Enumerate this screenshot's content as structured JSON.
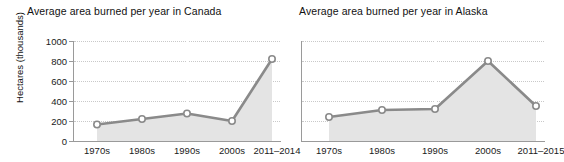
{
  "charts": {
    "canada": {
      "title": "Average area burned per year in Canada",
      "ylabel": "Hectares (thousands)",
      "yticks": [
        "1000",
        "800",
        "600",
        "400",
        "200",
        "0"
      ],
      "xticks": [
        "1970s",
        "1980s",
        "1990s",
        "2000s",
        "2011–2014"
      ]
    },
    "alaska": {
      "title": "Average area burned per year in Alaska",
      "xticks": [
        "1970s",
        "1980s",
        "1990s",
        "2000s",
        "2011–2015"
      ]
    }
  },
  "chart_data": [
    {
      "type": "line",
      "title": "Average area burned per year in Canada",
      "xlabel": "",
      "ylabel": "Hectares (thousands)",
      "categories": [
        "1970s",
        "1980s",
        "1990s",
        "2000s",
        "2011–2014"
      ],
      "values": [
        165,
        220,
        275,
        200,
        820
      ],
      "ylim": [
        0,
        1000
      ],
      "yticks": [
        0,
        200,
        400,
        600,
        800,
        1000
      ],
      "grid": true,
      "legend": "none",
      "marker": "open-circle",
      "fill": "area",
      "line_color": "#8a8a8a",
      "area_color": "#e4e4e4"
    },
    {
      "type": "line",
      "title": "Average area burned per year in Alaska",
      "xlabel": "",
      "ylabel": "Hectares (thousands)",
      "categories": [
        "1970s",
        "1980s",
        "1990s",
        "2000s",
        "2011–2015"
      ],
      "values": [
        240,
        310,
        320,
        800,
        350
      ],
      "ylim": [
        0,
        1000
      ],
      "yticks": [
        0,
        200,
        400,
        600,
        800,
        1000
      ],
      "grid": true,
      "legend": "none",
      "marker": "open-circle",
      "fill": "area",
      "line_color": "#8a8a8a",
      "area_color": "#e4e4e4"
    }
  ]
}
